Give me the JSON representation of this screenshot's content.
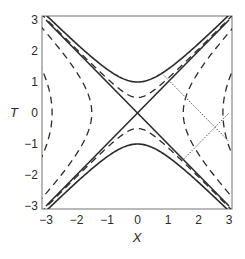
{
  "chart_data": {
    "type": "line",
    "title": "",
    "xlabel": "X",
    "ylabel": "T",
    "xlim": [
      -3,
      3
    ],
    "ylim": [
      -3,
      3
    ],
    "xticks": [
      -3,
      -2,
      -1,
      0,
      1,
      2,
      3
    ],
    "yticks": [
      -3,
      -2,
      -1,
      0,
      1,
      2,
      3
    ],
    "xtick_labels": [
      "−3",
      "−2",
      "−1",
      "0",
      "1",
      "2",
      "3"
    ],
    "ytick_labels": [
      "−3",
      "−2",
      "−1",
      "0",
      "1",
      "2",
      "3"
    ],
    "grid": false,
    "legend": null,
    "series": [
      {
        "name": "light-cone T=X",
        "style": "solid",
        "kind": "line",
        "points": [
          [
            -3,
            -3
          ],
          [
            3,
            3
          ]
        ]
      },
      {
        "name": "light-cone T=-X",
        "style": "solid",
        "kind": "line",
        "points": [
          [
            -3,
            3
          ],
          [
            3,
            -3
          ]
        ]
      },
      {
        "name": "timelike hyperbola T^2-X^2=1 (upper)",
        "style": "solid",
        "kind": "hyperbola-t",
        "a2": 1,
        "sign": 1
      },
      {
        "name": "timelike hyperbola T^2-X^2=1 (lower)",
        "style": "solid",
        "kind": "hyperbola-t",
        "a2": 1,
        "sign": -1
      },
      {
        "name": "timelike hyperbola T^2-X^2=0.25 (upper)",
        "style": "dashed",
        "kind": "hyperbola-t",
        "a2": 0.25,
        "sign": 1
      },
      {
        "name": "timelike hyperbola T^2-X^2=0.25 (lower)",
        "style": "dashed",
        "kind": "hyperbola-t",
        "a2": 0.25,
        "sign": -1
      },
      {
        "name": "spacelike hyperbola X^2-T^2=2.25 (right)",
        "style": "dashed",
        "kind": "hyperbola-x",
        "a2": 2.25,
        "sign": 1
      },
      {
        "name": "spacelike hyperbola X^2-T^2=2.25 (left)",
        "style": "dashed",
        "kind": "hyperbola-x",
        "a2": 2.25,
        "sign": -1
      },
      {
        "name": "spacelike hyperbola X^2-T^2=7.84 (right)",
        "style": "dashed",
        "kind": "hyperbola-x",
        "a2": 7.84,
        "sign": 1
      },
      {
        "name": "spacelike hyperbola X^2-T^2=7.84 (left)",
        "style": "dashed",
        "kind": "hyperbola-x",
        "a2": 7.84,
        "sign": -1
      },
      {
        "name": "dotted line 1",
        "style": "dotted",
        "kind": "line",
        "points": [
          [
            0.8,
            1.28
          ],
          [
            3,
            -0.92
          ]
        ]
      },
      {
        "name": "dotted line 2",
        "style": "dotted",
        "kind": "line",
        "points": [
          [
            1.5,
            -1.5
          ],
          [
            3,
            0
          ]
        ]
      }
    ]
  },
  "axes": {
    "xlabel": "X",
    "ylabel": "T"
  },
  "layout": {
    "frame": {
      "left": 42,
      "top": 16,
      "right": 232,
      "bottom": 209
    },
    "x0px": 46,
    "x1px": 229,
    "y0px": 206,
    "y1px": 20,
    "colors": {
      "line": "#2b2b2b",
      "frame": "#8a8a8a",
      "dotted": "#555555"
    }
  }
}
